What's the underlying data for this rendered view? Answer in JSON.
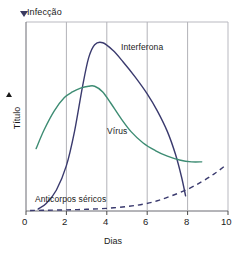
{
  "chart_data": {
    "type": "line",
    "title": "",
    "subtitle": "",
    "xlabel": "Dias",
    "ylabel": "Título",
    "ylabel_arrow": "up-arrow",
    "xlim": [
      0,
      10
    ],
    "ylim": [
      0,
      100
    ],
    "grid": "vertical gridlines at x = 2, 4, 6, 8",
    "legend_position": "inline curve labels",
    "xticks": [
      "0",
      "2",
      "4",
      "6",
      "8",
      "10"
    ],
    "xtick_values": [
      0,
      2,
      4,
      6,
      8,
      10
    ],
    "yticks": [],
    "annotations": [
      {
        "name": "infection-event",
        "text": "Infecção",
        "marker": "down-triangle",
        "x": 0,
        "y": 100
      }
    ],
    "series": [
      {
        "name": "Interferona",
        "label": "Interferona",
        "color": "#3a3a6e",
        "style": "solid",
        "x": [
          0.6,
          1.0,
          1.5,
          2.0,
          2.4,
          2.8,
          3.1,
          3.4,
          3.8,
          4.3,
          4.8,
          5.4,
          6.0,
          6.5,
          7.0,
          7.4,
          7.7,
          7.9
        ],
        "y": [
          1,
          4,
          11,
          24,
          42,
          66,
          81,
          88,
          89,
          85,
          79,
          71,
          62,
          53,
          42,
          30,
          18,
          8
        ]
      },
      {
        "name": "Vírus",
        "label": "Vírus",
        "color": "#3d8c73",
        "style": "solid",
        "x": [
          0.5,
          0.9,
          1.4,
          1.9,
          2.3,
          2.7,
          3.1,
          3.4,
          3.8,
          4.2,
          4.7,
          5.2,
          5.8,
          6.4,
          7.0,
          7.6,
          8.2,
          8.7
        ],
        "y": [
          33,
          43,
          53,
          60,
          63,
          65,
          66,
          66,
          63,
          57,
          49,
          42,
          36,
          32,
          29,
          27,
          26,
          26
        ]
      },
      {
        "name": "Anticorpos séricos",
        "label": "Anticorpos séricos",
        "color": "#3a3a6e",
        "style": "dashed",
        "x": [
          0.2,
          1.0,
          2.0,
          3.0,
          4.0,
          5.0,
          5.8,
          6.5,
          7.2,
          8.0,
          8.7,
          9.3,
          9.8
        ],
        "y": [
          0.3,
          0.4,
          0.6,
          0.9,
          1.4,
          2.4,
          3.6,
          5.4,
          8.0,
          11.5,
          15.5,
          19.5,
          23.5
        ]
      }
    ],
    "axis_colors": {
      "frame": "#b9b9c0",
      "gridline": "#b2b2b8",
      "axis": "#4a4a4a"
    }
  }
}
